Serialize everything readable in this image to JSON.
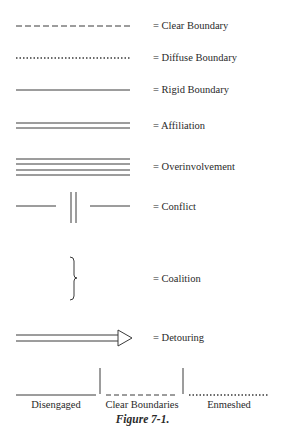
{
  "legend": [
    {
      "symbol": "dashed-line",
      "label": "= Clear Boundary"
    },
    {
      "symbol": "dotted-line",
      "label": "= Diffuse Boundary"
    },
    {
      "symbol": "solid-line",
      "label": "= Rigid Boundary"
    },
    {
      "symbol": "double-line",
      "label": "= Affiliation"
    },
    {
      "symbol": "quadruple-line",
      "label": "= Overinvolvement"
    },
    {
      "symbol": "broken-line-with-double-bar",
      "label": "= Conflict"
    },
    {
      "symbol": "right-brace",
      "label": "= Coalition"
    },
    {
      "symbol": "double-line-arrow",
      "label": "= Detouring"
    }
  ],
  "continuum": {
    "labels": [
      "Disengaged",
      "Clear Boundaries",
      "Enmeshed"
    ]
  },
  "caption": "Figure 7-1."
}
